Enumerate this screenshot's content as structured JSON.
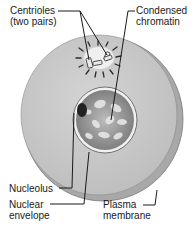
{
  "diagram": {
    "labels": {
      "centrioles_line1": "Centrioles",
      "centrioles_line2": "(two pairs)",
      "chromatin_line1": "Condensed",
      "chromatin_line2": "chromatin",
      "nucleolus": "Nucleolus",
      "nuclear_line1": "Nuclear",
      "nuclear_line2": "envelope",
      "plasma_line1": "Plasma",
      "plasma_line2": "membrane"
    },
    "colors": {
      "cytoplasm": "#c9c9c9",
      "rim": "#a9a9a9",
      "nucleus_dark": "#6e6e6e",
      "nucleus_light": "#d8d8d8",
      "line": "#1a1a1a"
    }
  }
}
